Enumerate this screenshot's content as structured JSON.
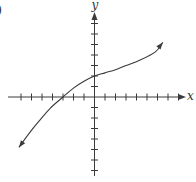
{
  "panel_label": ")",
  "chart_data": {
    "type": "line",
    "title": "",
    "xlabel": "x",
    "ylabel": "y",
    "xlim": [
      -8,
      8
    ],
    "ylim": [
      -7,
      7
    ],
    "grid": false,
    "legend": null,
    "x_ticks_left": 7,
    "x_ticks_right": 8,
    "y_ticks_up": 7,
    "y_ticks_down": 7,
    "tick_labels": false,
    "axis_arrows": {
      "x_positive": true,
      "y_positive": true
    },
    "series": [
      {
        "name": "f(x)",
        "arrows_both_ends": true,
        "x": [
          -7.2,
          -6.1,
          -5.2,
          -4.2,
          -3.0,
          -2.0,
          -1.0,
          0.0,
          1.0,
          2.0,
          3.0,
          4.3,
          5.8,
          6.5
        ],
        "y": [
          -4.8,
          -3.3,
          -2.2,
          -1.05,
          0.0,
          0.85,
          1.5,
          2.0,
          2.3,
          2.6,
          3.0,
          3.5,
          4.3,
          5.2
        ]
      }
    ],
    "key_points": [
      {
        "label": "x-intercept",
        "x": -3,
        "y": 0
      },
      {
        "label": "y-intercept",
        "x": 0,
        "y": 2
      }
    ]
  }
}
